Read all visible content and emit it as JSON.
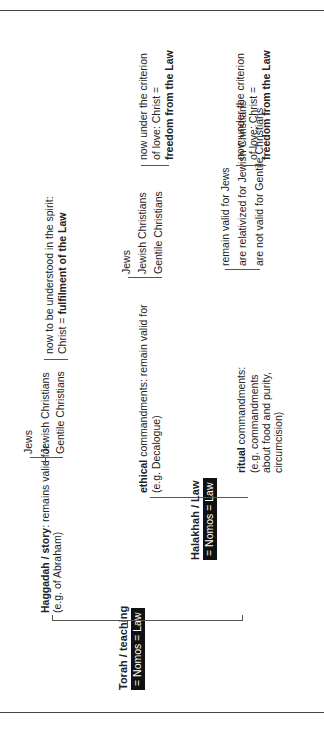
{
  "root": {
    "title": "Torah / teaching",
    "box": "= Nomos = Law"
  },
  "haggadah": {
    "title": "Haggadah / story",
    "rest": ": remains valid for",
    "example": "(e.g. of Abraham)",
    "groups": [
      "Jews",
      "Jewish Christians",
      "Gentile Christians"
    ],
    "result_line1": "now to be understood in the spirit:",
    "result_prefix": "Christ = ",
    "result_bold": "fulfilment of the Law"
  },
  "halakhah": {
    "title": "Halakhah / Law",
    "box": "= Nomos = Law"
  },
  "ethical": {
    "title": "ethical",
    "rest": " commandments: remain valid for",
    "example": "(e.g. Decalogue)",
    "groups": [
      "Jews",
      "Jewish Christians",
      "Gentile Christians"
    ],
    "result_line1": "now under the criterion",
    "result_line2": "of love: Christ =",
    "result_bold": "freedom from the Law"
  },
  "ritual": {
    "title": "ritual",
    "rest": " commandments:",
    "example_lines": [
      "(e.g. commandments",
      "about food and purity,",
      "circumcision)"
    ],
    "items": [
      "remain valid for Jews",
      "are relativized for Jewish Christians",
      "are not valid for Gentile Christians"
    ],
    "result_line1": "now under the criterion",
    "result_line2": "of love: Christ =",
    "result_bold": "freedom from the Law"
  }
}
